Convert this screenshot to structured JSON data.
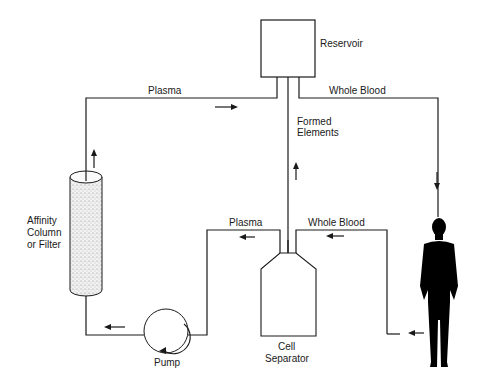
{
  "diagram": {
    "type": "apheresis-circuit",
    "labels": {
      "reservoir": "Reservoir",
      "plasma_top": "Plasma",
      "whole_blood_top": "Whole Blood",
      "formed_elements_1": "Formed",
      "formed_elements_2": "Elements",
      "affinity_1": "Affinity",
      "affinity_2": "Column",
      "affinity_3": "or Filter",
      "plasma_mid": "Plasma",
      "whole_blood_mid": "Whole Blood",
      "cell_1": "Cell",
      "cell_2": "Separator",
      "pump": "Pump"
    },
    "nodes": [
      "Reservoir",
      "Affinity Column or Filter",
      "Pump",
      "Cell Separator",
      "Patient"
    ],
    "flows": [
      {
        "from": "Reservoir",
        "to": "Patient",
        "label": "Whole Blood"
      },
      {
        "from": "Patient",
        "to": "Cell Separator",
        "label": "Whole Blood"
      },
      {
        "from": "Cell Separator",
        "to": "Reservoir",
        "label": "Formed Elements"
      },
      {
        "from": "Cell Separator",
        "to": "Pump",
        "label": "Plasma"
      },
      {
        "from": "Pump",
        "to": "Affinity Column or Filter",
        "label": ""
      },
      {
        "from": "Affinity Column or Filter",
        "to": "Reservoir",
        "label": "Plasma"
      }
    ],
    "colors": {
      "line": "#1a1a1a",
      "background": "#ffffff",
      "silhouette": "#000000"
    }
  }
}
